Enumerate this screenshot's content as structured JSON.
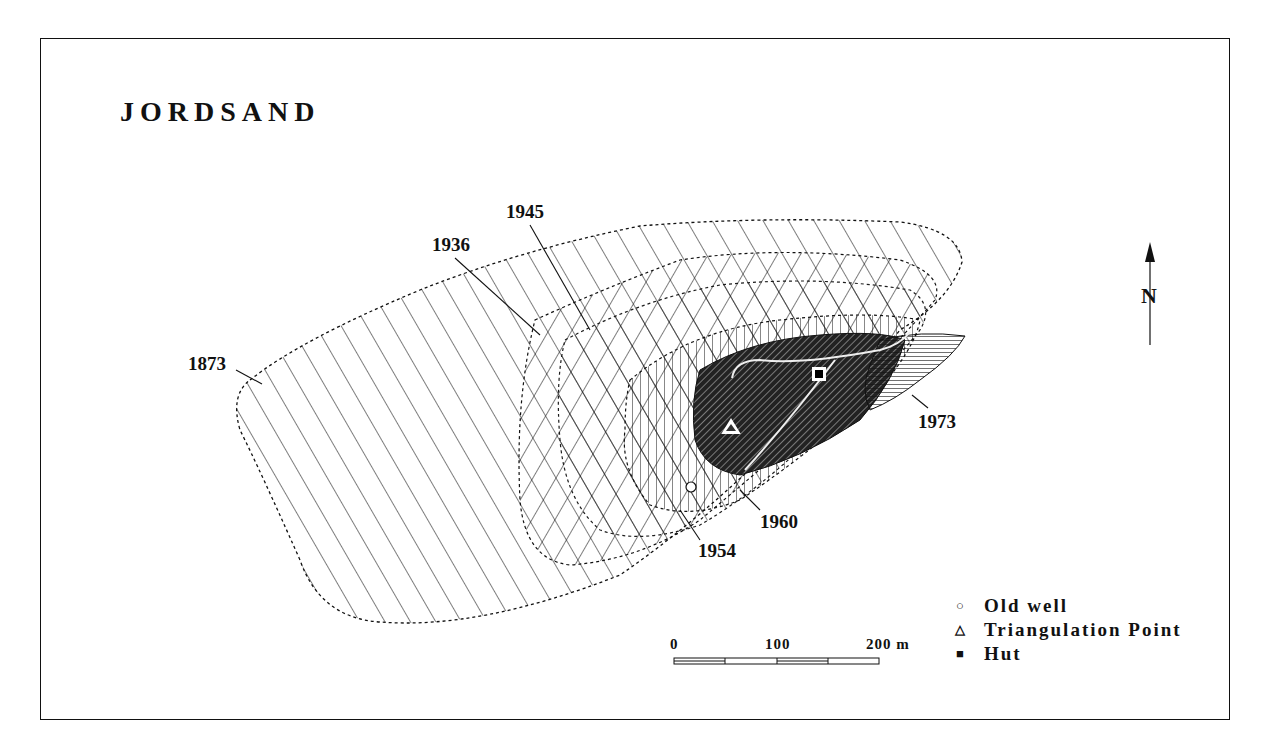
{
  "map": {
    "title": "JORDSAND",
    "north_label": "N",
    "year_labels": [
      {
        "year": "1873",
        "x": 188,
        "y": 370
      },
      {
        "year": "1936",
        "x": 432,
        "y": 251
      },
      {
        "year": "1945",
        "x": 506,
        "y": 218
      },
      {
        "year": "1954",
        "x": 698,
        "y": 557
      },
      {
        "year": "1960",
        "x": 760,
        "y": 528
      },
      {
        "year": "1973",
        "x": 918,
        "y": 428
      }
    ],
    "scale_bar": {
      "labels": [
        "0",
        "100",
        "200 m"
      ]
    },
    "legend": [
      {
        "symbol": "○",
        "icon": "circle-icon",
        "label": "Old well"
      },
      {
        "symbol": "△",
        "icon": "triangle-icon",
        "label": "Triangulation Point"
      },
      {
        "symbol": "■",
        "icon": "square-icon",
        "label": "Hut"
      }
    ]
  }
}
